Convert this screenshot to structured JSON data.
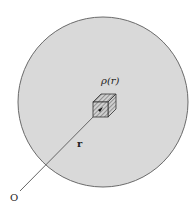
{
  "diagram": {
    "labels": {
      "density": "ρ(r)",
      "position_vector": "r",
      "origin": "O"
    },
    "colors": {
      "sphere_fill": "#d9d9d9",
      "sphere_stroke": "#6a6a6a",
      "line": "#666666",
      "cube_stroke": "#333333",
      "hatch": "#555555"
    }
  }
}
